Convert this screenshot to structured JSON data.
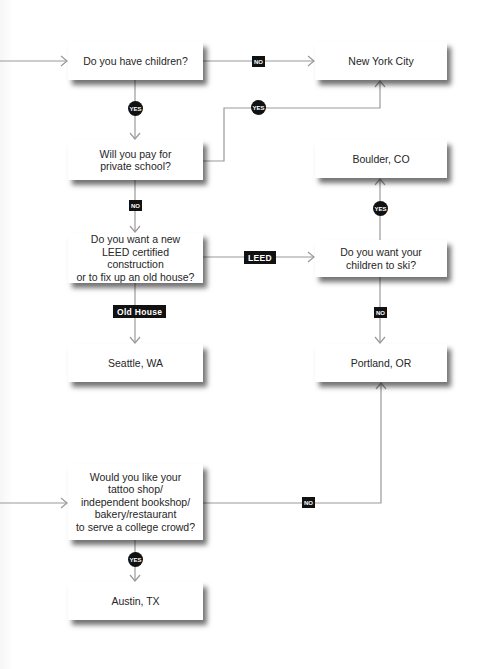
{
  "diagram": {
    "type": "flowchart",
    "line_color": "#9a9a9a",
    "badge_color": "#111111",
    "nodes": [
      {
        "id": "children",
        "kind": "question",
        "label": "Do you have children?"
      },
      {
        "id": "nyc",
        "kind": "result",
        "label": "New York City"
      },
      {
        "id": "private_school",
        "kind": "question",
        "label": "Will you pay for\nprivate school?"
      },
      {
        "id": "boulder",
        "kind": "result",
        "label": "Boulder, CO"
      },
      {
        "id": "leed",
        "kind": "question",
        "label": "Do you want a new\nLEED certified construction\nor to fix up an old house?"
      },
      {
        "id": "ski",
        "kind": "question",
        "label": "Do you want your\nchildren to ski?"
      },
      {
        "id": "seattle",
        "kind": "result",
        "label": "Seattle, WA"
      },
      {
        "id": "portland",
        "kind": "result",
        "label": "Portland, OR"
      },
      {
        "id": "college",
        "kind": "question",
        "label": "Would you like your\ntattoo shop/\nindependent bookshop/\nbakery/restaurant\nto serve a college crowd?"
      },
      {
        "id": "austin",
        "kind": "result",
        "label": "Austin, TX"
      }
    ],
    "edges": [
      {
        "from": "children",
        "to": "nyc",
        "label": "NO"
      },
      {
        "from": "children",
        "to": "private_school",
        "label": "YES"
      },
      {
        "from": "private_school",
        "to": "nyc",
        "label": "YES"
      },
      {
        "from": "private_school",
        "to": "leed",
        "label": "NO"
      },
      {
        "from": "leed",
        "to": "ski",
        "label": "LEED"
      },
      {
        "from": "leed",
        "to": "seattle",
        "label": "Old House"
      },
      {
        "from": "ski",
        "to": "boulder",
        "label": "YES"
      },
      {
        "from": "ski",
        "to": "portland",
        "label": "NO"
      },
      {
        "from": "college",
        "to": "portland",
        "label": "NO"
      },
      {
        "from": "college",
        "to": "austin",
        "label": "YES"
      }
    ]
  }
}
